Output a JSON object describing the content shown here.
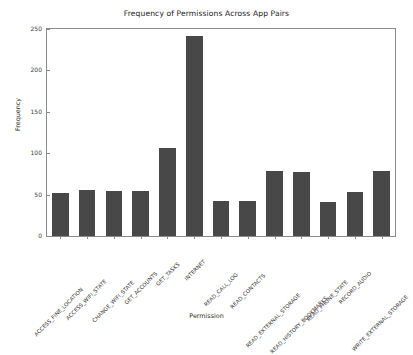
{
  "chart_data": {
    "type": "bar",
    "title": "Frequency of Permissions Across App Pairs",
    "xlabel": "Permission",
    "ylabel": "Frequency",
    "categories": [
      "ACCESS_FINE_LOCATION",
      "ACCESS_WIFI_STATE",
      "CHANGE_WIFI_STATE",
      "GET_ACCOUNTS",
      "GET_TASKS",
      "INTERNET",
      "READ_CALL_LOG",
      "READ_CONTACTS",
      "READ_EXTERNAL_STORAGE",
      "READ_HISTORY_BOOKMARKS",
      "READ_PHONE_STATE",
      "RECORD_AUDIO",
      "WRITE_EXTERNAL_STORAGE"
    ],
    "values": [
      52,
      55,
      54,
      54,
      106,
      241,
      42,
      42,
      79,
      77,
      41,
      53,
      78
    ],
    "ylim": [
      0,
      250
    ],
    "yticks": [
      0,
      50,
      100,
      150,
      200,
      250
    ],
    "ytick_labels": [
      "0",
      "50",
      "100",
      "150",
      "200",
      "250"
    ],
    "grid": false,
    "legend": null,
    "bar_color": "#484848",
    "background_color": "#ffffff",
    "axis_color": "#8a8a8a",
    "xtick_rotation_deg": -45
  }
}
